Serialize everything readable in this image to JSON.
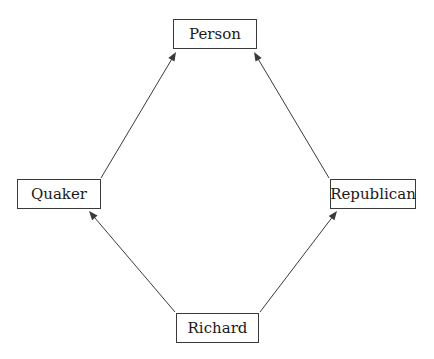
{
  "diagram": {
    "type": "inheritance-network",
    "background_color": "#ffffff",
    "stroke_color": "#3a3a3a",
    "text_color": "#1a1a1a",
    "width": 434,
    "height": 359,
    "nodes": [
      {
        "id": "person",
        "label": "Person",
        "x": 173,
        "y": 19,
        "w": 84,
        "h": 30,
        "font_size": 15
      },
      {
        "id": "quaker",
        "label": "Quaker",
        "x": 17,
        "y": 179,
        "w": 84,
        "h": 30,
        "font_size": 15
      },
      {
        "id": "republican",
        "label": "Republican",
        "x": 330,
        "y": 179,
        "w": 86,
        "h": 30,
        "font_size": 15
      },
      {
        "id": "richard",
        "label": "Richard",
        "x": 176,
        "y": 313,
        "w": 83,
        "h": 30,
        "font_size": 15
      }
    ],
    "edges": [
      {
        "id": "quaker-to-person",
        "from": "quaker",
        "to": "person",
        "x1": 101,
        "y1": 178,
        "x2": 176,
        "y2": 52,
        "arrow": "end"
      },
      {
        "id": "republican-to-person",
        "from": "republican",
        "to": "person",
        "x1": 329,
        "y1": 178,
        "x2": 254,
        "y2": 52,
        "arrow": "end"
      },
      {
        "id": "richard-to-quaker",
        "from": "richard",
        "to": "quaker",
        "x1": 175,
        "y1": 312,
        "x2": 89,
        "y2": 211,
        "arrow": "end"
      },
      {
        "id": "richard-to-republican",
        "from": "richard",
        "to": "republican",
        "x1": 260,
        "y1": 312,
        "x2": 337,
        "y2": 211,
        "arrow": "end"
      }
    ]
  }
}
